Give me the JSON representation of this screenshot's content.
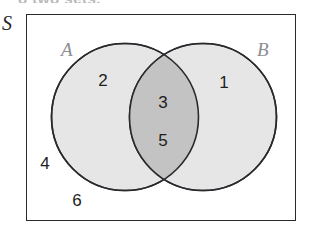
{
  "figure": {
    "type": "venn-diagram-two-sets",
    "caption_clipped": "o two sets.",
    "universal_set_label": "S",
    "sets": [
      {
        "id": "A",
        "label": "A",
        "side": "left"
      },
      {
        "id": "B",
        "label": "B",
        "side": "right"
      }
    ],
    "regions": [
      {
        "name": "A-only",
        "elements": [
          "2"
        ]
      },
      {
        "name": "A-and-B",
        "elements": [
          "3",
          "5"
        ]
      },
      {
        "name": "B-only",
        "elements": [
          "1"
        ]
      },
      {
        "name": "outside-both",
        "elements": [
          "4",
          "6"
        ]
      }
    ],
    "elements": {
      "a_only": "2",
      "intersection_top": "3",
      "intersection_bottom": "5",
      "b_only": "1",
      "outside_upper": "4",
      "outside_lower": "6"
    },
    "colors": {
      "circle_fill": "#e6e6e6",
      "intersection_fill": "#c3c3c3",
      "stroke": "#2a2a2e",
      "set_label": "#8d8d92",
      "element_text": "#1d1d20",
      "background": "#ffffff"
    }
  }
}
